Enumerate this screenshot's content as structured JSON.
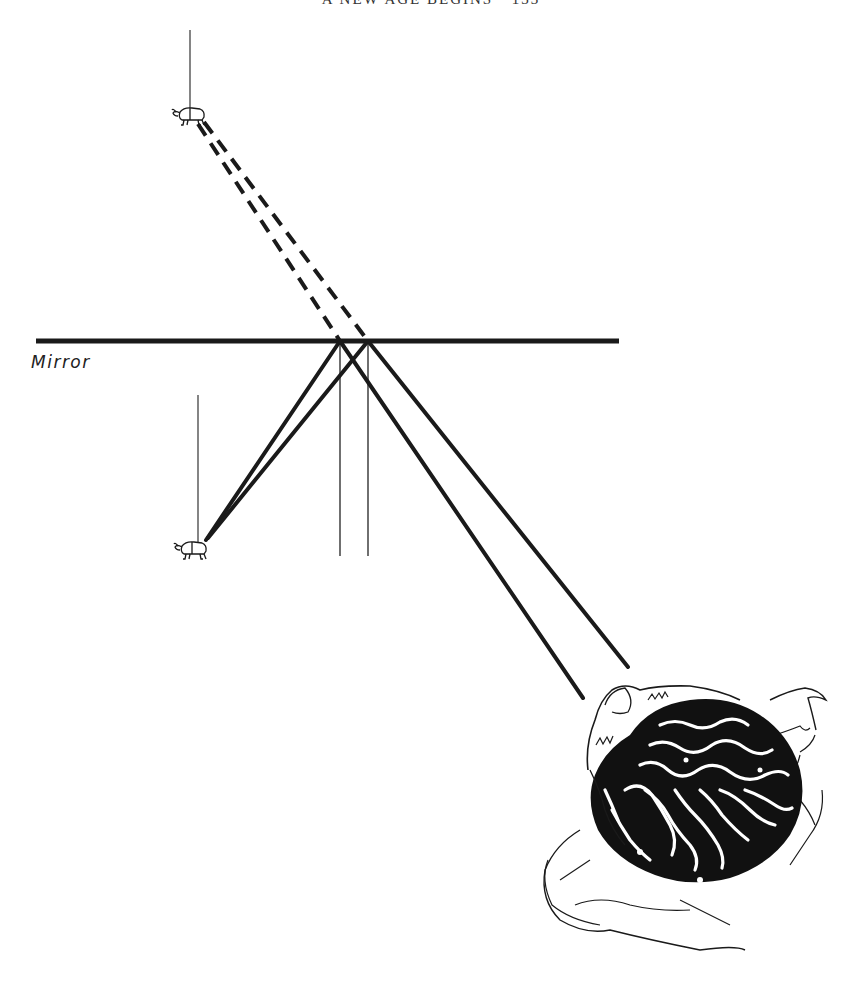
{
  "header": {
    "running_title": "A NEW AGE BEGINS",
    "page_number": "133",
    "text": "A NEW AGE BEGINS · 133"
  },
  "diagram": {
    "labels": {
      "mirror": "Mirror"
    },
    "elements": {
      "mirror": {
        "x1": 36,
        "y1": 341,
        "x2": 619,
        "y2": 341,
        "thickness": 5
      },
      "object_beetle": {
        "x": 190,
        "y": 550,
        "thread_top": 395
      },
      "image_beetle": {
        "x": 186,
        "y": 116,
        "thread_top": 30
      },
      "reflection_points": [
        {
          "x": 340,
          "y": 341
        },
        {
          "x": 368,
          "y": 341
        }
      ],
      "observer_eye_points": [
        {
          "x": 583,
          "y": 698
        },
        {
          "x": 628,
          "y": 667
        }
      ],
      "normal_line_bottom": 556
    },
    "line_styles": {
      "real_ray": "solid",
      "virtual_ray": "dashed",
      "normal": "thin solid"
    },
    "colors": {
      "ink": "#1a1a1a",
      "paper": "#ffffff"
    }
  }
}
